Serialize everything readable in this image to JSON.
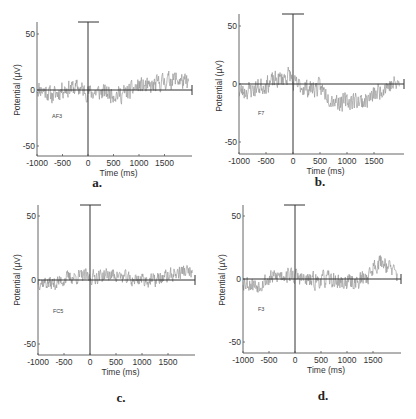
{
  "figure": {
    "panels_order": [
      "a",
      "b",
      "c",
      "d"
    ]
  },
  "chart_data": [
    {
      "type": "line",
      "panel_letter": "a.",
      "channel_label": "AF3",
      "xlabel": "Time (ms)",
      "ylabel": "Potential (µV)",
      "xlim": [
        -1000,
        2000
      ],
      "ylim": [
        -60,
        60
      ],
      "xticks": [
        -1000,
        -500,
        0,
        500,
        1000,
        1500
      ],
      "xtick_labels": [
        "-1000",
        "-500",
        "0",
        "500",
        "1000",
        "1500"
      ],
      "yticks": [
        50,
        0,
        -50
      ],
      "ytick_labels": [
        "50",
        "0",
        "-50"
      ],
      "grid": false,
      "stimulus_marker": {
        "x": 0,
        "y_top": 60
      },
      "series": [
        {
          "name": "AF3",
          "color": "#9a9a9a",
          "trend_x": [
            -1000,
            -800,
            -700,
            -500,
            -200,
            0,
            300,
            600,
            800,
            1000,
            1200,
            1500,
            1700,
            1950
          ],
          "trend_y": [
            2,
            -2,
            -6,
            1,
            2,
            -2,
            -2,
            -4,
            -2,
            4,
            2,
            8,
            10,
            6
          ],
          "noise_amp": 7,
          "seed": 11
        }
      ]
    },
    {
      "type": "line",
      "panel_letter": "b.",
      "channel_label": "F7",
      "xlabel": "Time (ms)",
      "ylabel": "Potential (µV)",
      "xlim": [
        -1000,
        2000
      ],
      "ylim": [
        -60,
        60
      ],
      "xticks": [
        -1000,
        -500,
        0,
        500,
        1000,
        1500
      ],
      "xtick_labels": [
        "-1000",
        "-500",
        "0",
        "500",
        "1000",
        "1500"
      ],
      "yticks": [
        50,
        0,
        -50
      ],
      "ytick_labels": [
        "50",
        "0",
        "-50"
      ],
      "grid": false,
      "stimulus_marker": {
        "x": 0,
        "y_top": 60
      },
      "series": [
        {
          "name": "F7",
          "color": "#9a9a9a",
          "trend_x": [
            -1000,
            -700,
            -500,
            -200,
            -50,
            0,
            300,
            500,
            700,
            900,
            1100,
            1300,
            1500,
            1700,
            1950
          ],
          "trend_y": [
            -7,
            -4,
            0,
            5,
            8,
            0,
            -4,
            -3,
            -12,
            -16,
            -14,
            -15,
            -10,
            -2,
            0
          ],
          "noise_amp": 7,
          "seed": 23
        }
      ]
    },
    {
      "type": "line",
      "panel_letter": "c.",
      "channel_label": "FC5",
      "xlabel": "Time (ms)",
      "ylabel": "Potential (µV)",
      "xlim": [
        -1000,
        2000
      ],
      "ylim": [
        -60,
        60
      ],
      "xticks": [
        -1000,
        -500,
        0,
        500,
        1000,
        1500
      ],
      "xtick_labels": [
        "-1000",
        "-500",
        "0",
        "500",
        "1000",
        "1500"
      ],
      "yticks": [
        50,
        0,
        -50
      ],
      "ytick_labels": [
        "50",
        "0",
        "-50"
      ],
      "grid": false,
      "stimulus_marker": {
        "x": 0,
        "y_top": 60
      },
      "series": [
        {
          "name": "FC5",
          "color": "#9a9a9a",
          "trend_x": [
            -1000,
            -700,
            -400,
            -100,
            0,
            300,
            500,
            800,
            1000,
            1200,
            1500,
            1800,
            1950
          ],
          "trend_y": [
            -1,
            -3,
            2,
            3,
            2,
            4,
            4,
            0,
            1,
            -1,
            3,
            7,
            6
          ],
          "noise_amp": 5,
          "seed": 37
        }
      ]
    },
    {
      "type": "line",
      "panel_letter": "d.",
      "channel_label": "F3",
      "xlabel": "Time (ms)",
      "ylabel": "Potential (µV)",
      "xlim": [
        -1000,
        2000
      ],
      "ylim": [
        -60,
        60
      ],
      "xticks": [
        -1000,
        -500,
        0,
        500,
        1000,
        1500
      ],
      "xtick_labels": [
        "-1000",
        "-500",
        "0",
        "500",
        "1000",
        "1500"
      ],
      "yticks": [
        50,
        0,
        -50
      ],
      "ytick_labels": [
        "50",
        "0",
        "-50"
      ],
      "grid": false,
      "stimulus_marker": {
        "x": 0,
        "y_top": 60
      },
      "series": [
        {
          "name": "F3",
          "color": "#9a9a9a",
          "trend_x": [
            -1000,
            -750,
            -500,
            -200,
            0,
            300,
            600,
            900,
            1200,
            1400,
            1550,
            1700,
            1850,
            1950
          ],
          "trend_y": [
            -2,
            -5,
            0,
            4,
            2,
            -2,
            0,
            -3,
            -2,
            2,
            12,
            14,
            8,
            3
          ],
          "noise_amp": 6,
          "seed": 53
        }
      ]
    }
  ],
  "layout": {
    "panels": [
      {
        "ax_x0": 37,
        "ax_x1": 192,
        "zero_x": 88,
        "ax_y_top": 22,
        "ax_y_bottom": 156,
        "y_at_50": 34,
        "y_at_0": 90,
        "y_at_m50": 146,
        "bar_x0": 78,
        "bar_x1": 99,
        "letter_x": 97,
        "letter_y": 187,
        "chan_x": 52,
        "chan_y": 118,
        "ylabel_x": 20,
        "ylabel_y": 90
      },
      {
        "ax_x0": 239,
        "ax_x1": 404,
        "zero_x": 293,
        "ax_y_top": 14,
        "ax_y_bottom": 154,
        "y_at_50": 26,
        "y_at_0": 84,
        "y_at_m50": 143,
        "bar_x0": 282,
        "bar_x1": 304,
        "letter_x": 320,
        "letter_y": 186,
        "chan_x": 258,
        "chan_y": 115,
        "ylabel_x": 222,
        "ylabel_y": 86
      },
      {
        "ax_x0": 38,
        "ax_x1": 195,
        "zero_x": 90,
        "ax_y_top": 205,
        "ax_y_bottom": 355,
        "y_at_50": 216,
        "y_at_0": 280,
        "y_at_m50": 343,
        "bar_x0": 80,
        "bar_x1": 101,
        "letter_x": 121,
        "letter_y": 402,
        "chan_x": 53,
        "chan_y": 313,
        "ylabel_x": 20,
        "ylabel_y": 280
      },
      {
        "ax_x0": 243,
        "ax_x1": 401,
        "zero_x": 295,
        "ax_y_top": 205,
        "ax_y_bottom": 353,
        "y_at_50": 216,
        "y_at_0": 279,
        "y_at_m50": 342,
        "bar_x0": 284,
        "bar_x1": 305,
        "letter_x": 323,
        "letter_y": 400,
        "chan_x": 258,
        "chan_y": 311,
        "ylabel_x": 225,
        "ylabel_y": 280
      }
    ]
  }
}
